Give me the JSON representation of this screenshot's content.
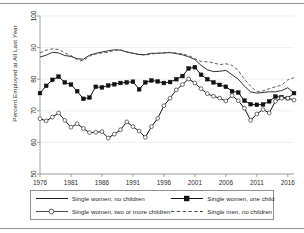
{
  "chart_data": {
    "type": "line",
    "title": "",
    "xlabel": "",
    "ylabel": "Percent Employed at All Last Year",
    "xlim": [
      1976,
      2017
    ],
    "ylim": [
      50,
      100
    ],
    "grid": true,
    "legend_position": "bottom",
    "xticks": [
      1976,
      1981,
      1986,
      1991,
      1996,
      2001,
      2006,
      2011,
      2016
    ],
    "yticks": [
      50,
      60,
      70,
      80,
      90,
      100
    ],
    "x": [
      1976,
      1977,
      1978,
      1979,
      1980,
      1981,
      1982,
      1983,
      1984,
      1985,
      1986,
      1987,
      1988,
      1989,
      1990,
      1991,
      1992,
      1993,
      1994,
      1995,
      1996,
      1997,
      1998,
      1999,
      2000,
      2001,
      2002,
      2003,
      2004,
      2005,
      2006,
      2007,
      2008,
      2009,
      2010,
      2011,
      2012,
      2013,
      2014,
      2015,
      2016,
      2017
    ],
    "series": [
      {
        "name": "Single women, no children",
        "marker": "none",
        "style": "solid",
        "color": "#1a1a1a",
        "values": [
          87.0,
          87.6,
          88.5,
          88.3,
          87.5,
          87.2,
          86.5,
          86.3,
          87.6,
          88.2,
          88.6,
          89.0,
          89.3,
          89.2,
          88.6,
          88.2,
          87.8,
          87.8,
          88.2,
          88.2,
          88.3,
          88.4,
          88.1,
          87.7,
          87.1,
          86.2,
          84.4,
          83.0,
          82.4,
          82.5,
          82.8,
          81.4,
          80.0,
          77.8,
          76.0,
          75.6,
          75.8,
          76.0,
          76.0,
          76.4,
          77.3,
          75.6
        ]
      },
      {
        "name": "Single women, one child",
        "marker": "square",
        "style": "solid",
        "color": "#111111",
        "values": [
          75.6,
          77.9,
          79.8,
          80.8,
          79.0,
          78.3,
          76.2,
          73.8,
          74.2,
          77.6,
          77.4,
          78.0,
          78.4,
          78.8,
          79.0,
          79.2,
          76.8,
          79.0,
          79.6,
          79.3,
          78.8,
          79.1,
          80.0,
          81.0,
          83.4,
          83.8,
          81.4,
          80.0,
          79.0,
          78.2,
          77.6,
          76.2,
          75.8,
          73.2,
          72.1,
          71.9,
          72.0,
          73.0,
          74.5,
          74.3,
          74.0,
          75.6
        ]
      },
      {
        "name": "Single women, two or more children",
        "marker": "circle",
        "style": "solid",
        "color": "#4a4a4a",
        "values": [
          67.5,
          66.8,
          68.0,
          69.3,
          67.0,
          64.8,
          65.9,
          64.4,
          63.1,
          63.2,
          63.4,
          61.4,
          62.6,
          64.0,
          66.5,
          65.0,
          63.6,
          61.6,
          65.0,
          67.6,
          71.6,
          74.0,
          76.6,
          78.3,
          80.1,
          78.8,
          77.0,
          75.4,
          74.6,
          74.0,
          73.1,
          74.8,
          73.2,
          70.8,
          67.0,
          69.0,
          70.4,
          69.3,
          73.0,
          74.0,
          74.0,
          73.4
        ]
      },
      {
        "name": "Single men, no children",
        "marker": "none",
        "style": "dashed",
        "color": "#4a4a4a",
        "values": [
          88.3,
          89.2,
          89.6,
          89.4,
          88.3,
          87.5,
          86.2,
          85.8,
          87.3,
          88.0,
          88.3,
          88.5,
          89.2,
          89.3,
          88.7,
          88.2,
          87.8,
          87.6,
          88.0,
          88.2,
          88.4,
          88.5,
          88.3,
          88.0,
          87.5,
          86.5,
          85.6,
          85.5,
          85.2,
          84.6,
          84.9,
          84.4,
          82.8,
          80.0,
          77.8,
          76.0,
          76.3,
          77.0,
          77.6,
          78.1,
          79.8,
          80.5
        ]
      }
    ]
  },
  "axis": {
    "ylabel": "Percent Employed at All Last Year",
    "ytick_labels": [
      "100",
      "90",
      "80",
      "70",
      "60",
      "50"
    ],
    "xtick_labels": [
      "1976",
      "1981",
      "1986",
      "1991",
      "1996",
      "2001",
      "2006",
      "2011",
      "2016"
    ]
  },
  "legend": {
    "items": [
      {
        "label": "Single women, no children",
        "key": "solid-line-key"
      },
      {
        "label": "Single women, one child",
        "key": "solid-square-marker-key"
      },
      {
        "label": "Single women, two or more children",
        "key": "solid-circle-marker-key"
      },
      {
        "label": "Single men, no children",
        "key": "dashed-line-key"
      }
    ]
  }
}
